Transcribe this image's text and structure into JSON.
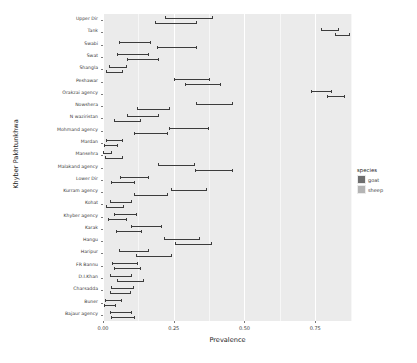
{
  "chart_data": {
    "type": "bar",
    "title": "",
    "subtitle": "",
    "orientation": "horizontal",
    "xlabel": "Prevalence",
    "ylabel": "Khyber Pakhtunkhwa",
    "xlim": [
      0,
      0.88
    ],
    "xticks": [
      0.0,
      0.25,
      0.5,
      0.75
    ],
    "xticklabels": [
      "0.00",
      "0.25",
      "0.50",
      "0.75"
    ],
    "grid": true,
    "grid_orientation": "vertical",
    "legend": {
      "title": "species",
      "position": "right",
      "entries": [
        {
          "label": "goat",
          "color": "#6e6e6e"
        },
        {
          "label": "sheep",
          "color": "#b4b4b4"
        }
      ]
    },
    "categories": [
      "Upper Dir",
      "Tank",
      "Swabi",
      "Swat",
      "Shangla",
      "Peshawar",
      "Orakzai agency",
      "Nowshera",
      "N waziristan",
      "Mohmand agency",
      "Mardan",
      "Mansehra",
      "Malakand agency",
      "Lower Dir",
      "Kurram agency",
      "Kohat",
      "Khyber agency",
      "Karak",
      "Hangu",
      "Haripur",
      "FR Bannu",
      "D.I.Khan",
      "Charsadda",
      "Buner",
      "Bajaur agency"
    ],
    "series": [
      {
        "name": "goat",
        "color": "#6e6e6e",
        "values": [
          0.295,
          0.8,
          0.095,
          0.09,
          0.042,
          0.31,
          0.77,
          0.39,
          0.13,
          0.3,
          0.028,
          0.003,
          0.255,
          0.1,
          0.3,
          0.05,
          0.068,
          0.145,
          0.275,
          0.095,
          0.065,
          0.05,
          0.055,
          0.024,
          0.05
        ],
        "err_low": [
          0.22,
          0.77,
          0.055,
          0.05,
          0.022,
          0.25,
          0.735,
          0.33,
          0.085,
          0.235,
          0.01,
          0.0,
          0.195,
          0.06,
          0.24,
          0.025,
          0.038,
          0.1,
          0.215,
          0.055,
          0.032,
          0.024,
          0.028,
          0.008,
          0.024
        ],
        "err_high": [
          0.385,
          0.83,
          0.165,
          0.16,
          0.08,
          0.375,
          0.805,
          0.455,
          0.195,
          0.37,
          0.068,
          0.03,
          0.32,
          0.16,
          0.365,
          0.1,
          0.118,
          0.205,
          0.34,
          0.16,
          0.12,
          0.1,
          0.105,
          0.062,
          0.1
        ]
      },
      {
        "name": "sheep",
        "color": "#b4b4b4",
        "values": [
          0.25,
          0.845,
          0.255,
          0.13,
          0.03,
          0.35,
          0.82,
          0.17,
          0.075,
          0.16,
          0.016,
          0.028,
          0.39,
          0.06,
          0.16,
          0.032,
          0.04,
          0.08,
          0.315,
          0.17,
          0.075,
          0.085,
          0.052,
          0.012,
          0.06
        ],
        "err_low": [
          0.185,
          0.82,
          0.19,
          0.085,
          0.012,
          0.29,
          0.79,
          0.12,
          0.04,
          0.11,
          0.003,
          0.008,
          0.325,
          0.028,
          0.11,
          0.012,
          0.018,
          0.045,
          0.255,
          0.115,
          0.04,
          0.048,
          0.026,
          0.002,
          0.03
        ],
        "err_high": [
          0.33,
          0.87,
          0.33,
          0.195,
          0.068,
          0.415,
          0.85,
          0.235,
          0.13,
          0.225,
          0.048,
          0.068,
          0.455,
          0.11,
          0.225,
          0.07,
          0.08,
          0.135,
          0.38,
          0.24,
          0.13,
          0.14,
          0.095,
          0.042,
          0.11
        ]
      }
    ]
  },
  "axis": {
    "x_title": "Prevalence",
    "y_title": "Khyber Pakhtunkhwa"
  },
  "legend": {
    "title": "species"
  },
  "colors": {
    "panel_background": "#ebebeb",
    "grid_major": "#ffffff",
    "goat": "#6e6e6e",
    "sheep": "#b4b4b4",
    "error_bar": "#3c3c3c"
  }
}
